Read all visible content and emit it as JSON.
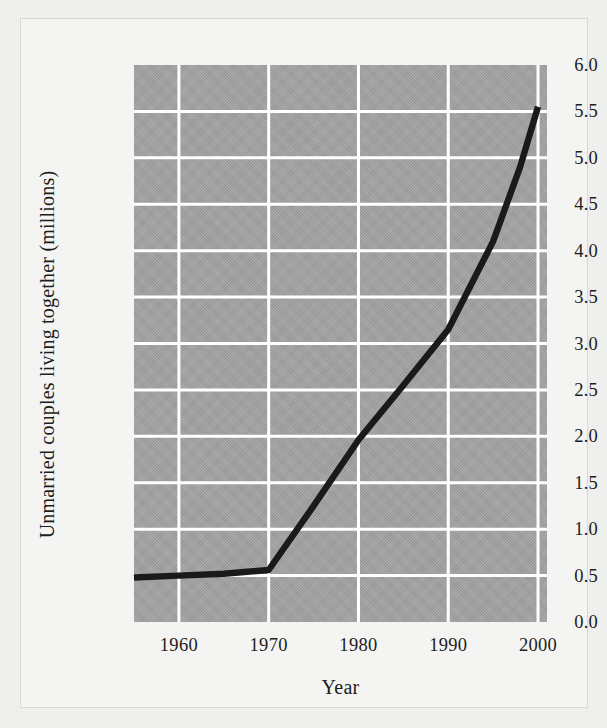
{
  "figure": {
    "background_color": "#f2f2f1",
    "plot_background_color": "#a3a3a3",
    "gridline_color": "#ffffff",
    "line_color": "#1a1a1a",
    "frame_border_color": "#d8d8d6"
  },
  "chart_data": {
    "type": "line",
    "title": "",
    "xlabel": "Year",
    "ylabel": "Unmarried couples living together (millions)",
    "xlim": [
      1955,
      2001
    ],
    "ylim": [
      0.0,
      6.0
    ],
    "grid": true,
    "legend": "none",
    "xticks": [
      "1960",
      "1970",
      "1980",
      "1990",
      "2000"
    ],
    "xtick_values": [
      1960,
      1970,
      1980,
      1990,
      2000
    ],
    "yticks": [
      "0.0",
      "0.5",
      "1.0",
      "1.5",
      "2.0",
      "2.5",
      "3.0",
      "3.5",
      "4.0",
      "4.5",
      "5.0",
      "5.5",
      "6.0"
    ],
    "ytick_values": [
      0.0,
      0.5,
      1.0,
      1.5,
      2.0,
      2.5,
      3.0,
      3.5,
      4.0,
      4.5,
      5.0,
      5.5,
      6.0
    ],
    "series": [
      {
        "name": "Unmarried couples living together",
        "color": "#1a1a1a",
        "x": [
          1955,
          1960,
          1965,
          1970,
          1975,
          1980,
          1985,
          1990,
          1995,
          1998,
          2000
        ],
        "values": [
          0.48,
          0.5,
          0.52,
          0.56,
          1.25,
          1.96,
          2.55,
          3.15,
          4.1,
          4.9,
          5.55
        ]
      }
    ]
  }
}
